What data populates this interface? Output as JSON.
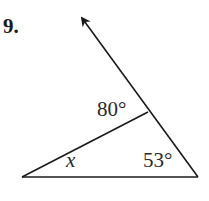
{
  "problem": {
    "number": "9."
  },
  "diagram": {
    "type": "triangle-with-exterior-ray",
    "labels": {
      "angle_top": "80°",
      "angle_right": "53°",
      "angle_left": "x"
    },
    "points": {
      "left_vertex": [
        22,
        177
      ],
      "right_vertex": [
        198,
        177
      ],
      "intersection": [
        148,
        112
      ],
      "ray_tip": [
        80,
        15
      ]
    },
    "line_color": "#1a1a1a"
  }
}
